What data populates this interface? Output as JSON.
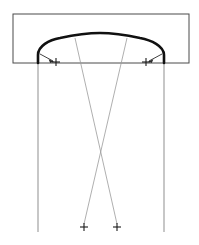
{
  "figure": {
    "width": 199,
    "height": 245,
    "background_color": "#ffffff"
  },
  "colors": {
    "curve_stroke": "#111111",
    "rect_stroke": "#4a4a4a",
    "thin_stroke": "#8f8f8f",
    "diagonal_stroke": "#9a9a9a",
    "mark_stroke": "#1a1a1a",
    "leader_stroke": "#2b2b2b"
  },
  "strokes": {
    "curve_width": 2.6,
    "rect_width": 1.0,
    "jamb_width": 1.0,
    "diagonal_width": 0.8,
    "leader_width": 0.9,
    "mark_width": 1.1
  },
  "bounding_rect": {
    "label": "enclosing-rectangle",
    "x": 13,
    "y": 14,
    "width": 176,
    "height": 49
  },
  "arch_curve": {
    "label": "arch-profile",
    "apex": {
      "x": 100,
      "y": 33
    },
    "left_springing": {
      "x": 38,
      "y": 63
    },
    "right_springing": {
      "x": 164,
      "y": 63
    },
    "path": "M 38 63 L 38 55 C 38 46 49 40 60 38 C 74 35 88 33 100 33 C 112 33 126 35 140 38 C 151 40 164 46 164 55 L 164 63"
  },
  "jamb_lines": [
    {
      "label": "left-jamb",
      "x1": 38,
      "y1": 63,
      "x2": 38,
      "y2": 232
    },
    {
      "label": "right-jamb",
      "x1": 164,
      "y1": 63,
      "x2": 164,
      "y2": 232
    }
  ],
  "diagonal_lines": [
    {
      "label": "diagonal-left-to-right",
      "x1": 75,
      "y1": 38,
      "x2": 117,
      "y2": 224
    },
    {
      "label": "diagonal-right-to-left",
      "x1": 127,
      "y1": 38,
      "x2": 84,
      "y2": 224
    }
  ],
  "intersection_point": {
    "x": 100,
    "y": 155
  },
  "center_marks": [
    {
      "label": "upper-left-center-mark",
      "x": 56,
      "y": 62,
      "arm": 4
    },
    {
      "label": "upper-right-center-mark",
      "x": 146,
      "y": 62,
      "arm": 4
    },
    {
      "label": "lower-left-center-mark",
      "x": 84,
      "y": 227,
      "arm": 4
    },
    {
      "label": "lower-right-center-mark",
      "x": 117,
      "y": 227,
      "arm": 4
    }
  ],
  "leader_arrows": [
    {
      "label": "left-radius-leader",
      "from": {
        "x": 40,
        "y": 54
      },
      "to": {
        "x": 54,
        "y": 61
      },
      "direction": "right"
    },
    {
      "label": "right-radius-leader",
      "from": {
        "x": 162,
        "y": 54
      },
      "to": {
        "x": 148,
        "y": 61
      },
      "direction": "left"
    }
  ]
}
